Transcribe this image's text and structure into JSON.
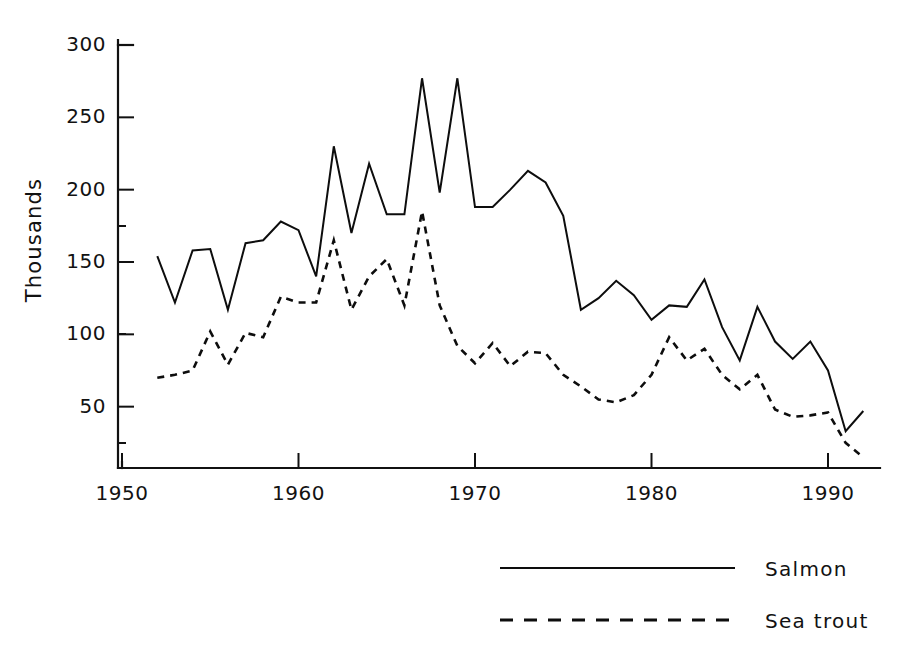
{
  "chart_data": {
    "type": "line",
    "title": "",
    "subtitle": "",
    "xlabel": "",
    "ylabel": "Thousands",
    "xlim": [
      1950,
      1993
    ],
    "ylim": [
      0,
      300
    ],
    "grid": false,
    "legend_position": "bottom-right",
    "xticks": [
      1950,
      1960,
      1970,
      1980,
      1990
    ],
    "xtick_labels": [
      "1950",
      "1960",
      "1970",
      "1980",
      "1990"
    ],
    "yticks": [
      50,
      100,
      150,
      200,
      250,
      300
    ],
    "ytick_labels": [
      "50",
      "100",
      "150",
      "200",
      "250",
      "300"
    ],
    "x": [
      1952,
      1953,
      1954,
      1955,
      1956,
      1957,
      1958,
      1959,
      1960,
      1961,
      1962,
      1963,
      1964,
      1965,
      1966,
      1967,
      1968,
      1969,
      1970,
      1971,
      1972,
      1973,
      1974,
      1975,
      1976,
      1977,
      1978,
      1979,
      1980,
      1981,
      1982,
      1983,
      1984,
      1985,
      1986,
      1987,
      1988,
      1989,
      1990,
      1991,
      1992
    ],
    "series": [
      {
        "name": "Salmon",
        "style": "solid",
        "color": "#0d0d0d",
        "values": [
          154,
          122,
          158,
          159,
          117,
          163,
          165,
          178,
          172,
          140,
          230,
          170,
          218,
          183,
          183,
          277,
          198,
          277,
          188,
          188,
          200,
          213,
          205,
          182,
          117,
          125,
          137,
          127,
          110,
          120,
          119,
          138,
          105,
          82,
          119,
          95,
          83,
          95,
          75,
          33,
          47
        ]
      },
      {
        "name": "Sea trout",
        "style": "dashed",
        "color": "#0d0d0d",
        "values": [
          70,
          72,
          75,
          102,
          79,
          101,
          98,
          126,
          122,
          122,
          165,
          117,
          140,
          152,
          120,
          185,
          120,
          92,
          80,
          94,
          78,
          88,
          87,
          72,
          64,
          55,
          53,
          58,
          72,
          98,
          82,
          90,
          72,
          62,
          72,
          48,
          43,
          44,
          46,
          25,
          15
        ]
      }
    ],
    "legend": [
      {
        "label": "Salmon",
        "style": "solid"
      },
      {
        "label": "Sea trout",
        "style": "dashed"
      }
    ]
  },
  "axis": {
    "y_title": "Thousands"
  },
  "legend": {
    "salmon_label": "Salmon",
    "seatrout_label": "Sea trout"
  }
}
